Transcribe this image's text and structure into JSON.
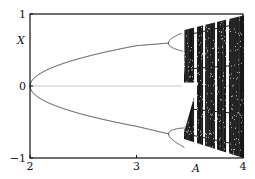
{
  "chart_data": {
    "type": "scatter",
    "title": "",
    "xlabel": "A",
    "ylabel": "X",
    "xlim": [
      2,
      4
    ],
    "ylim": [
      -1,
      1
    ],
    "x_ticks": [
      {
        "value": 2,
        "label": "2"
      },
      {
        "value": 3,
        "label": "3"
      },
      {
        "value": 4,
        "label": "4"
      }
    ],
    "y_ticks": [
      {
        "value": 1,
        "label": "1"
      },
      {
        "value": 0,
        "label": "0"
      },
      {
        "value": -1,
        "label": "−1"
      }
    ],
    "zero_line": 0,
    "series": [
      {
        "name": "upper-branch",
        "x": [
          2.0,
          2.1,
          2.3,
          2.5,
          2.7,
          2.9,
          3.0
        ],
        "y": [
          0.0,
          0.22,
          0.36,
          0.44,
          0.5,
          0.55,
          0.56
        ]
      },
      {
        "name": "lower-branch",
        "x": [
          2.0,
          2.1,
          2.3,
          2.5,
          2.7,
          2.9,
          3.0
        ],
        "y": [
          0.0,
          -0.22,
          -0.36,
          -0.44,
          -0.5,
          -0.55,
          -0.56
        ]
      }
    ],
    "chaos_onset": 3.45,
    "periodic_windows": [
      3.55,
      3.63,
      3.74,
      3.85
    ]
  }
}
